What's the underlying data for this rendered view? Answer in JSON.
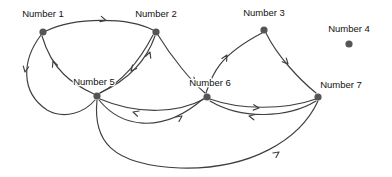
{
  "diagram": {
    "type": "directed-graph",
    "canvas": {
      "width": 392,
      "height": 177,
      "background": "#ffffff"
    },
    "style": {
      "node_color": "#555555",
      "node_radius": 3.6,
      "edge_color": "#3f3f3f",
      "edge_width": 1.15,
      "label_color": "#111111",
      "label_font_size": 9.5
    },
    "nodes": [
      {
        "id": "n1",
        "label": "Number 1",
        "x": 43,
        "y": 32,
        "label_x": 43,
        "label_y": 17
      },
      {
        "id": "n2",
        "label": "Number 2",
        "x": 156,
        "y": 32,
        "label_x": 156,
        "label_y": 17
      },
      {
        "id": "n3",
        "label": "Number 3",
        "x": 264,
        "y": 30,
        "label_x": 264,
        "label_y": 16
      },
      {
        "id": "n4",
        "label": "Number 4",
        "x": 349,
        "y": 44,
        "label_x": 349,
        "label_y": 32
      },
      {
        "id": "n5",
        "label": "Number 5",
        "x": 97,
        "y": 96,
        "label_x": 94,
        "label_y": 85
      },
      {
        "id": "n6",
        "label": "Number 6",
        "x": 207,
        "y": 97,
        "label_x": 210,
        "label_y": 86
      },
      {
        "id": "n7",
        "label": "Number 7",
        "x": 318,
        "y": 97,
        "label_x": 341,
        "label_y": 88
      }
    ],
    "edges": [
      {
        "id": "e1",
        "from": "n1",
        "to": "n2",
        "path": "M 46 31 C 75 17 128 17 153 30",
        "arrow": {
          "x": 106,
          "y": 20.5,
          "angle": 15
        }
      },
      {
        "id": "e2",
        "from": "n1",
        "to": "n5",
        "path": "M 41 35 C 22 60 20 92 47 110 C 65 120 85 112 95 100",
        "arrow": {
          "x": 25,
          "y": 72,
          "angle": 100
        }
      },
      {
        "id": "e3",
        "from": "n5",
        "to": "n1",
        "path": "M 94 94 C 72 84 52 70 42 36",
        "arrow": {
          "x": 53,
          "y": 61,
          "angle": 249
        }
      },
      {
        "id": "e4",
        "from": "n2",
        "to": "n5",
        "path": "M 153 35 C 140 60 122 82 100 93",
        "arrow": {
          "x": 131,
          "y": 71,
          "angle": 131
        }
      },
      {
        "id": "e5",
        "from": "n5",
        "to": "n2",
        "path": "M 100 93 C 128 80 146 62 155 36",
        "arrow": {
          "x": 150,
          "y": 52,
          "angle": 289
        }
      },
      {
        "id": "e6",
        "from": "n2",
        "to": "n6",
        "path": "M 158 35 C 172 58 192 82 205 93",
        "arrow": {
          "x": 196,
          "y": 83,
          "angle": 44
        }
      },
      {
        "id": "e7",
        "from": "n6",
        "to": "n3",
        "path": "M 206 93 C 212 75 218 56 262 33",
        "arrow": {
          "x": 227,
          "y": 55,
          "angle": 300
        }
      },
      {
        "id": "e8",
        "from": "n3",
        "to": "n7",
        "path": "M 266 33 C 277 56 300 80 316 93",
        "arrow": {
          "x": 288,
          "y": 64,
          "angle": 48
        }
      },
      {
        "id": "e9",
        "from": "n6",
        "to": "n5",
        "path": "M 204 99 C 180 112 140 116 100 99",
        "arrow": {
          "x": 133,
          "y": 112,
          "angle": 197
        }
      },
      {
        "id": "e10",
        "from": "n5",
        "to": "n6",
        "path": "M 99 100 C 120 126 160 136 203 99",
        "arrow": {
          "x": 182,
          "y": 116,
          "angle": 325
        }
      },
      {
        "id": "e11",
        "from": "n6",
        "to": "n7",
        "path": "M 210 99 C 240 110 285 110 316 99",
        "arrow": {
          "x": 259,
          "y": 108,
          "angle": 6
        }
      },
      {
        "id": "e12",
        "from": "n7",
        "to": "n6",
        "path": "M 316 101 C 288 118 242 120 210 101",
        "arrow": {
          "x": 249,
          "y": 116,
          "angle": 192
        }
      },
      {
        "id": "e13",
        "from": "n5",
        "to": "n7",
        "path": "M 97 100 C 93 140 110 165 180 168 C 250 170 300 140 318 101",
        "arrow": {
          "x": 279,
          "y": 152,
          "angle": 325
        }
      }
    ],
    "edge_list_text": [
      "Number 1 -> Number 2",
      "Number 1 -> Number 5",
      "Number 5 -> Number 1",
      "Number 2 -> Number 5",
      "Number 5 -> Number 2",
      "Number 2 -> Number 6",
      "Number 6 -> Number 3",
      "Number 3 -> Number 7",
      "Number 6 -> Number 5",
      "Number 5 -> Number 6",
      "Number 6 -> Number 7",
      "Number 7 -> Number 6",
      "Number 5 -> Number 7"
    ]
  }
}
